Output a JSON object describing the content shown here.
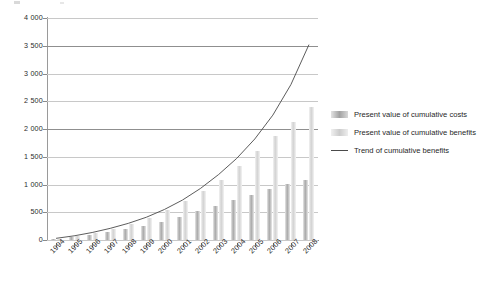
{
  "chart_data": {
    "type": "bar",
    "title": "",
    "subtitle": "",
    "xlabel": "",
    "ylabel": "",
    "ylim": [
      0,
      4000
    ],
    "ytick_step": 500,
    "yticks": [
      "0",
      "500",
      "1 000",
      "1 500",
      "2 000",
      "2 500",
      "3 000",
      "3 500",
      "4 000"
    ],
    "grid": true,
    "legend_position": "right",
    "categories": [
      "1994",
      "1995",
      "1996",
      "1997",
      "1998",
      "1999",
      "2000",
      "2001",
      "2002",
      "2003",
      "2004",
      "2005",
      "2006",
      "2007",
      "2008"
    ],
    "series": [
      {
        "name": "Present value of cumulative costs",
        "color": "#a8a8a8",
        "values": [
          20,
          55,
          95,
          140,
          190,
          250,
          330,
          420,
          520,
          620,
          720,
          820,
          920,
          1010,
          1090
        ]
      },
      {
        "name": "Present value of cumulative benefits",
        "color": "#d2d2d2",
        "values": [
          25,
          70,
          130,
          200,
          290,
          400,
          540,
          700,
          880,
          1090,
          1330,
          1600,
          1880,
          2130,
          2400
        ]
      },
      {
        "name": "Trend of cumulative benefits",
        "type": "line",
        "color": "#4a4a4a",
        "values": [
          30,
          75,
          135,
          210,
          300,
          410,
          550,
          720,
          930,
          1180,
          1470,
          1820,
          2250,
          2800,
          3520
        ]
      }
    ],
    "legend": [
      {
        "label": "Present value of cumulative costs",
        "swatch": "costs"
      },
      {
        "label": "Present value of cumulative benefits",
        "swatch": "benefits"
      },
      {
        "label": "Trend of cumulative benefits",
        "swatch": "line"
      }
    ]
  }
}
